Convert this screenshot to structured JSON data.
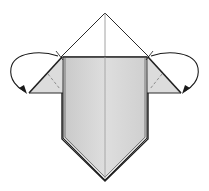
{
  "diagram": {
    "type": "origami-step",
    "description": "Fold both side flaps behind along dashed valley lines",
    "colors": {
      "paper_front": "#d4d4d4",
      "paper_front_light": "#e2e2e2",
      "flap": "#dcdcdc",
      "line": "#2b2b2b",
      "crease": "#8a8a8a",
      "arrow": "#1a1a1a",
      "background": "#ffffff"
    },
    "parts": {
      "top_triangle": "white top triangle with center crease",
      "body": "shaded pentagon body with vertical center crease",
      "left_flap": "shaded triangular flap with dashed fold line",
      "right_flap": "shaded triangular flap with dashed fold line",
      "left_arrow": "curved fold-behind arrow",
      "right_arrow": "curved fold-behind arrow"
    }
  }
}
